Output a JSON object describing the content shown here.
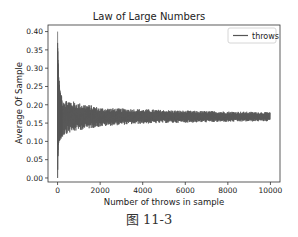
{
  "chart_data": {
    "type": "line",
    "title": "Law of Large Numbers",
    "xlabel": "Number of throws in sample",
    "ylabel": "Average Of Sample",
    "xlim": [
      -450,
      10450
    ],
    "ylim": [
      -0.011,
      0.418
    ],
    "xticks": [
      0,
      2000,
      4000,
      6000,
      8000,
      10000
    ],
    "xtick_labels": [
      "0",
      "2000",
      "4000",
      "6000",
      "8000",
      "10000"
    ],
    "yticks": [
      0.0,
      0.05,
      0.1,
      0.15,
      0.2,
      0.25,
      0.3,
      0.35,
      0.4
    ],
    "ytick_labels": [
      "0.00",
      "0.05",
      "0.10",
      "0.15",
      "0.20",
      "0.25",
      "0.30",
      "0.35",
      "0.40"
    ],
    "grid": false,
    "legend_position": "upper right",
    "series": [
      {
        "name": "throws",
        "color": "#555555",
        "converges_to": 0.1667,
        "x_range": [
          1,
          10000
        ],
        "envelope": {
          "x": [
            1,
            20,
            50,
            100,
            200,
            400,
            700,
            1000,
            1500,
            2000,
            3000,
            4000,
            5000,
            6000,
            7000,
            8000,
            9000,
            10000
          ],
          "upper": [
            0.4,
            0.33,
            0.28,
            0.25,
            0.22,
            0.215,
            0.21,
            0.205,
            0.2,
            0.192,
            0.19,
            0.188,
            0.186,
            0.184,
            0.183,
            0.182,
            0.181,
            0.18
          ],
          "lower": [
            0.0,
            0.07,
            0.09,
            0.1,
            0.11,
            0.12,
            0.125,
            0.13,
            0.135,
            0.14,
            0.145,
            0.148,
            0.15,
            0.151,
            0.152,
            0.153,
            0.154,
            0.155
          ]
        }
      }
    ]
  },
  "figure": {
    "caption": "图 11-3"
  }
}
